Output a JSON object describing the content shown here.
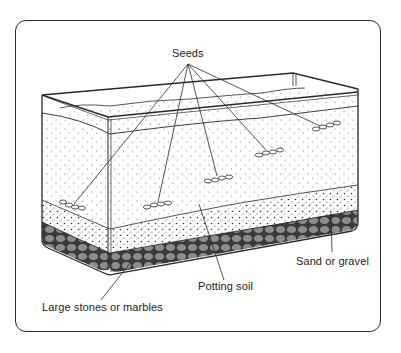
{
  "diagram": {
    "labels": {
      "seeds": "Seeds",
      "sand_or_gravel": "Sand or gravel",
      "potting_soil": "Potting soil",
      "large_stones": "Large stones or marbles"
    },
    "layers": [
      {
        "name": "Potting soil",
        "pattern": "sparse dots",
        "color": "#ffffff"
      },
      {
        "name": "Sand or gravel",
        "pattern": "dense speckles",
        "color": "#ffffff"
      },
      {
        "name": "Large stones or marbles",
        "pattern": "gray ovals",
        "color": "#8c8c8c"
      }
    ],
    "seed_clusters": [
      {
        "x": 72,
        "y": 205
      },
      {
        "x": 160,
        "y": 205
      },
      {
        "x": 222,
        "y": 179
      },
      {
        "x": 272,
        "y": 152
      },
      {
        "x": 330,
        "y": 126
      }
    ],
    "colors": {
      "line": "#2a2a2a",
      "stones": "#8c8c8c",
      "stone_mortar": "#3a3a3a",
      "background": "#ffffff"
    }
  }
}
